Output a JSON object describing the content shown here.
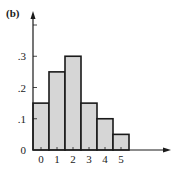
{
  "chart_data": {
    "type": "bar",
    "title": "",
    "panel_label": "(b)",
    "xlabel": "",
    "ylabel": "",
    "categories": [
      "0",
      "1",
      "2",
      "3",
      "4",
      "5"
    ],
    "values": [
      0.15,
      0.25,
      0.3,
      0.15,
      0.1,
      0.05
    ],
    "ylim": [
      0,
      0.4
    ],
    "yticks": [
      0,
      0.1,
      0.2,
      0.3,
      0.4
    ],
    "ytick_labels": [
      "0",
      ".1",
      ".2",
      ".3",
      ""
    ],
    "grid": false,
    "legend": "none",
    "bar_fill": "#d6d6d6",
    "bar_stroke": "#1a1a1a"
  }
}
